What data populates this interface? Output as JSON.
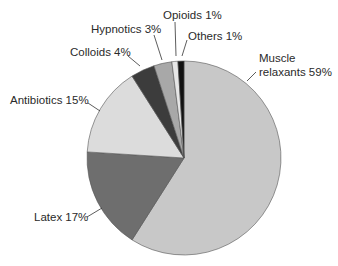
{
  "chart_data": {
    "type": "pie",
    "title": "",
    "start_angle_deg": 0,
    "direction": "clockwise",
    "slices": [
      {
        "label": "Muscle relaxants",
        "value": 59,
        "display": "Muscle\nrelaxants 59%",
        "color": "#c8c8c8"
      },
      {
        "label": "Latex",
        "value": 17,
        "display": "Latex 17%",
        "color": "#6e6e6e"
      },
      {
        "label": "Antibiotics",
        "value": 15,
        "display": "Antibiotics 15%",
        "color": "#dcdcdc"
      },
      {
        "label": "Colloids",
        "value": 4,
        "display": "Colloids 4%",
        "color": "#3c3c3c"
      },
      {
        "label": "Hypnotics",
        "value": 3,
        "display": "Hypnotics 3%",
        "color": "#a8a8a8"
      },
      {
        "label": "Opioids",
        "value": 1,
        "display": "Opioids 1%",
        "color": "#e6e6e6"
      },
      {
        "label": "Others",
        "value": 1,
        "display": "Others 1%",
        "color": "#111111"
      }
    ],
    "legend": "none",
    "labels_style": "outside with leader lines"
  },
  "labels": {
    "muscle_line1": "Muscle",
    "muscle_line2": "relaxants 59%",
    "latex": "Latex 17%",
    "antibiotics": "Antibiotics 15%",
    "colloids": "Colloids 4%",
    "hypnotics": "Hypnotics 3%",
    "opioids": "Opioids 1%",
    "others": "Others 1%"
  }
}
